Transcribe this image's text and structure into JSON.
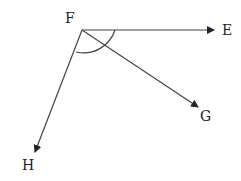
{
  "diagram": {
    "vertex": {
      "label": "F",
      "x": 82,
      "y": 30
    },
    "rays": [
      {
        "id": "E",
        "label": "E",
        "x2": 214,
        "y2": 30,
        "lx": 222,
        "ly": 35
      },
      {
        "id": "G",
        "label": "G",
        "x2": 198,
        "y2": 107,
        "lx": 200,
        "ly": 121
      },
      {
        "id": "H",
        "label": "H",
        "x2": 35,
        "y2": 152,
        "lx": 22,
        "ly": 170
      }
    ],
    "angle_arc": {
      "from": "E",
      "to": "H",
      "radius": 33
    },
    "line_color": "#444444"
  }
}
